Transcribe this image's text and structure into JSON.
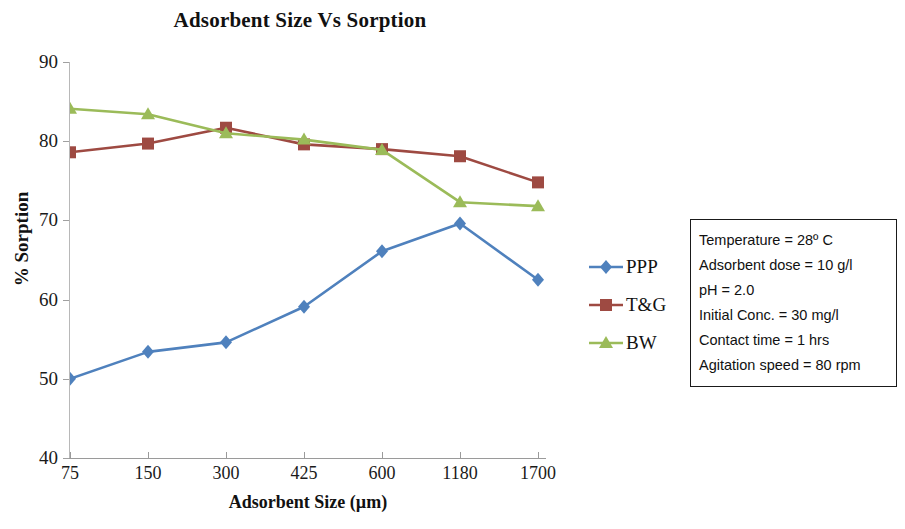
{
  "chart_data": {
    "type": "line",
    "title": "Adsorbent Size Vs Sorption",
    "xlabel": "Adsorbent Size (µm)",
    "ylabel": "% Sorption",
    "categories": [
      "75",
      "150",
      "300",
      "425",
      "600",
      "1180",
      "1700"
    ],
    "ylim": [
      40,
      90
    ],
    "yticks": [
      "40",
      "50",
      "60",
      "70",
      "80",
      "90"
    ],
    "ytick_step": 10,
    "grid": false,
    "legend_position": "right",
    "series": [
      {
        "name": "PPP",
        "color": "#4F81BD",
        "marker": "diamond",
        "values": [
          50.0,
          53.4,
          54.6,
          59.1,
          66.1,
          69.6,
          62.5
        ]
      },
      {
        "name": "T&G",
        "color": "#9E4A42",
        "marker": "square",
        "values": [
          78.6,
          79.7,
          81.7,
          79.6,
          79.0,
          78.1,
          74.8
        ]
      },
      {
        "name": "BW",
        "color": "#9BBB59",
        "marker": "triangle",
        "values": [
          84.1,
          83.4,
          81.0,
          80.2,
          78.9,
          72.3,
          71.8
        ]
      }
    ]
  },
  "annotation": {
    "lines": [
      "Temperature = 28º C",
      "Adsorbent dose = 10 g/l",
      "pH = 2.0",
      "Initial Conc. = 30 mg/l",
      "Contact time = 1 hrs",
      "Agitation speed = 80 rpm"
    ]
  }
}
